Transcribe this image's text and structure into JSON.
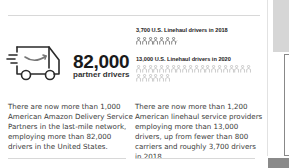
{
  "left_panel": {
    "icon": "delivery-truck-icon",
    "stat_value": "82,000",
    "stat_label": "partner drivers",
    "description": "There are now more than 1,000 American Amazon Delivery Service Partners in the last-mile network, employing more than 82,000 drivers in the United States."
  },
  "right_panel": {
    "stat_2018_label": "3,700 U.S. Linehaul drivers in 2018",
    "stat_2018_icon_count": 7,
    "stat_2020_label": "13,000 U.S. Linehaul drivers in 2020",
    "stat_2020_icon_count_row1": 20,
    "stat_2020_icon_count_row2": 6,
    "icon": "person-icon",
    "description": "There are now more than 1,200 American linehaul service providers employing more than 13,000 drivers, up from fewer than 800 carriers and roughly 3,700 drivers in 2018."
  },
  "colors": {
    "text": "#3a3a3a",
    "heading": "#1a1a1a",
    "icon_2018": "#555555",
    "icon_2020": "#b5b5b5",
    "divider": "#d8d8d8"
  }
}
